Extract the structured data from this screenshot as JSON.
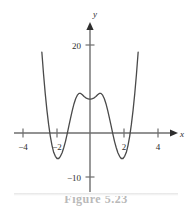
{
  "figure": {
    "caption": "Figure  5.23",
    "background_color": "#ffffff",
    "curve_color": "#4a4a4a",
    "axis_color": "#6e6e6e",
    "text_color": "#2e2e2e"
  },
  "axes": {
    "x_axis_label": "x",
    "y_axis_label": "y",
    "x_ticks": [
      {
        "value": -4,
        "label": "−4",
        "px": 23
      },
      {
        "value": -2,
        "label": "−2",
        "px": 57
      },
      {
        "value": 2,
        "label": "2",
        "px": 124
      },
      {
        "value": 4,
        "label": "4",
        "px": 158
      }
    ],
    "y_ticks": [
      {
        "value": 20,
        "label": "20",
        "px": 45
      },
      {
        "value": -10,
        "label": "−10",
        "px": 177
      }
    ]
  },
  "chart_data": {
    "type": "line",
    "title": "",
    "subtitle": "",
    "xlabel": "x",
    "ylabel": "y",
    "xlim": [
      -3.2,
      3.4
    ],
    "ylim": [
      -12,
      24
    ],
    "grid": false,
    "legend": false,
    "legend_position": "none",
    "annotations": [],
    "features": {
      "local_maximum": {
        "x": 0,
        "y": 9
      },
      "local_minima": [
        {
          "x": -2,
          "y": -5.5
        },
        {
          "x": 2,
          "y": -5.5
        }
      ],
      "roots": [
        -2.45,
        -1.3,
        1.3,
        2.45
      ],
      "y_intercept": 9,
      "end_behavior": "both branches rise steeply"
    },
    "series": [
      {
        "name": "curve",
        "x": [
          -2.95,
          -2.85,
          -2.75,
          -2.65,
          -2.55,
          -2.45,
          -2.35,
          -2.25,
          -2.15,
          -2.05,
          -1.95,
          -1.85,
          -1.75,
          -1.65,
          -1.55,
          -1.45,
          -1.35,
          -1.25,
          -1.15,
          -1.05,
          -0.95,
          -0.85,
          -0.75,
          -0.65,
          -0.55,
          -0.45,
          -0.35,
          -0.25,
          -0.15,
          -0.05,
          0.05,
          0.15,
          0.25,
          0.35,
          0.45,
          0.55,
          0.65,
          0.75,
          0.85,
          0.95,
          1.05,
          1.15,
          1.25,
          1.35,
          1.45,
          1.55,
          1.65,
          1.75,
          1.85,
          1.95,
          2.05,
          2.15,
          2.25,
          2.35,
          2.45,
          2.55,
          2.65,
          2.75,
          2.85,
          2.95
        ],
        "y": [
          24.1,
          18.4,
          13.4,
          9.0,
          5.2,
          2.0,
          -0.7,
          -2.8,
          -4.4,
          -5.3,
          -5.8,
          -5.8,
          -5.3,
          -4.5,
          -3.3,
          -1.9,
          -0.2,
          1.6,
          3.4,
          5.1,
          6.6,
          7.8,
          8.6,
          9.0,
          9.0,
          8.7,
          8.3,
          8.0,
          7.8,
          7.7,
          7.7,
          7.8,
          8.0,
          8.3,
          8.7,
          9.0,
          9.0,
          8.6,
          7.8,
          6.6,
          5.1,
          3.4,
          1.6,
          -0.2,
          -1.9,
          -3.3,
          -4.5,
          -5.3,
          -5.8,
          -5.8,
          -5.3,
          -4.4,
          -2.8,
          -0.7,
          2.0,
          5.2,
          9.0,
          13.4,
          18.4,
          24.1
        ]
      }
    ]
  }
}
